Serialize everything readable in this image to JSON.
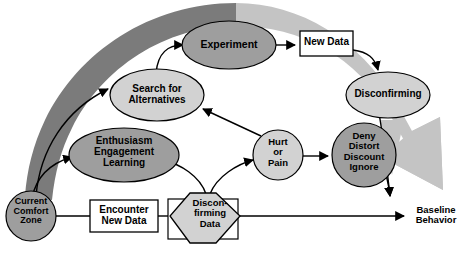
{
  "diagram": {
    "colors": {
      "dark_band": "#7b7b7b",
      "light_band": "#c4c4c4",
      "node_dark": "#9e9e9e",
      "node_light": "#d2d2d2",
      "node_white": "#ffffff",
      "stroke": "#000000",
      "background": "#ffffff"
    },
    "nodes": [
      {
        "id": "current-comfort-zone",
        "label": "Current\nComfort\nZone",
        "shape": "circle",
        "fill": "node_dark"
      },
      {
        "id": "encounter-new-data",
        "label": "Encounter\nNew Data",
        "shape": "rect",
        "fill": "node_white"
      },
      {
        "id": "disconfirming-data",
        "label": "Discon-\nfirming\nData",
        "shape": "hexagon",
        "fill": "node_light"
      },
      {
        "id": "enthusiasm-engagement-learning",
        "label": "Enthusiasm\nEngagement\nLearning",
        "shape": "ellipse",
        "fill": "node_dark"
      },
      {
        "id": "search-for-alternatives",
        "label": "Search for\nAlternatives",
        "shape": "ellipse",
        "fill": "node_light"
      },
      {
        "id": "experiment",
        "label": "Experiment",
        "shape": "ellipse",
        "fill": "node_dark"
      },
      {
        "id": "new-data",
        "label": "New Data",
        "shape": "rect",
        "fill": "node_white"
      },
      {
        "id": "disconfirming",
        "label": "Disconfirming",
        "shape": "ellipse",
        "fill": "node_light"
      },
      {
        "id": "hurt-or-pain",
        "label": "Hurt\nor\nPain",
        "shape": "circle",
        "fill": "node_light"
      },
      {
        "id": "deny-distort-discount-ignore",
        "label": "Deny\nDistort\nDiscount\nIgnore",
        "shape": "circle",
        "fill": "node_dark"
      },
      {
        "id": "baseline-behavior",
        "label": "Baseline\nBehavior",
        "shape": "text",
        "fill": "none"
      }
    ],
    "labels": {
      "current_comfort_zone": "Current\nComfort\nZone",
      "encounter_new_data": "Encounter\nNew Data",
      "disconfirming_data": "Discon-\nfirming\nData",
      "enthusiasm": "Enthusiasm\nEngagement\nLearning",
      "search_alternatives": "Search for\nAlternatives",
      "experiment": "Experiment",
      "new_data": "New Data",
      "disconfirming": "Disconfirming",
      "hurt_or_pain": "Hurt\nor\nPain",
      "deny": "Deny\nDistort\nDiscount\nIgnore",
      "baseline_behavior": "Baseline\nBehavior"
    },
    "edges": [
      {
        "from": "current-comfort-zone",
        "to": "encounter-new-data",
        "style": "line"
      },
      {
        "from": "encounter-new-data",
        "to": "disconfirming-data",
        "style": "line"
      },
      {
        "from": "disconfirming-data",
        "to": "baseline-behavior",
        "style": "arrow"
      },
      {
        "from": "disconfirming-data",
        "to": "enthusiasm-engagement-learning",
        "style": "curved-arrow"
      },
      {
        "from": "disconfirming-data",
        "to": "hurt-or-pain",
        "style": "curved-arrow"
      },
      {
        "from": "hurt-or-pain",
        "to": "search-for-alternatives",
        "style": "arrow"
      },
      {
        "from": "hurt-or-pain",
        "to": "deny-distort-discount-ignore",
        "style": "arrow"
      },
      {
        "from": "search-for-alternatives",
        "to": "experiment",
        "style": "curved-arrow"
      },
      {
        "from": "experiment",
        "to": "new-data",
        "style": "arrow"
      },
      {
        "from": "new-data",
        "to": "disconfirming",
        "style": "curved-arrow"
      },
      {
        "from": "current-comfort-zone",
        "to": "search-for-alternatives",
        "style": "curved-arrow"
      },
      {
        "from": "current-comfort-zone",
        "to": "enthusiasm-engagement-learning",
        "style": "curved-arrow"
      },
      {
        "from": "disconfirming",
        "to": "baseline-behavior",
        "style": "curved-arrow"
      },
      {
        "from": "deny-distort-discount-ignore",
        "to": "baseline-behavior",
        "style": "curved-arrow"
      }
    ],
    "bands": [
      {
        "id": "dark-band",
        "from": "current-comfort-zone",
        "to": "top-arc",
        "fill": "dark_band"
      },
      {
        "id": "light-band-arrow",
        "from": "top-arc",
        "to": "baseline-behavior",
        "fill": "light_band"
      }
    ]
  }
}
